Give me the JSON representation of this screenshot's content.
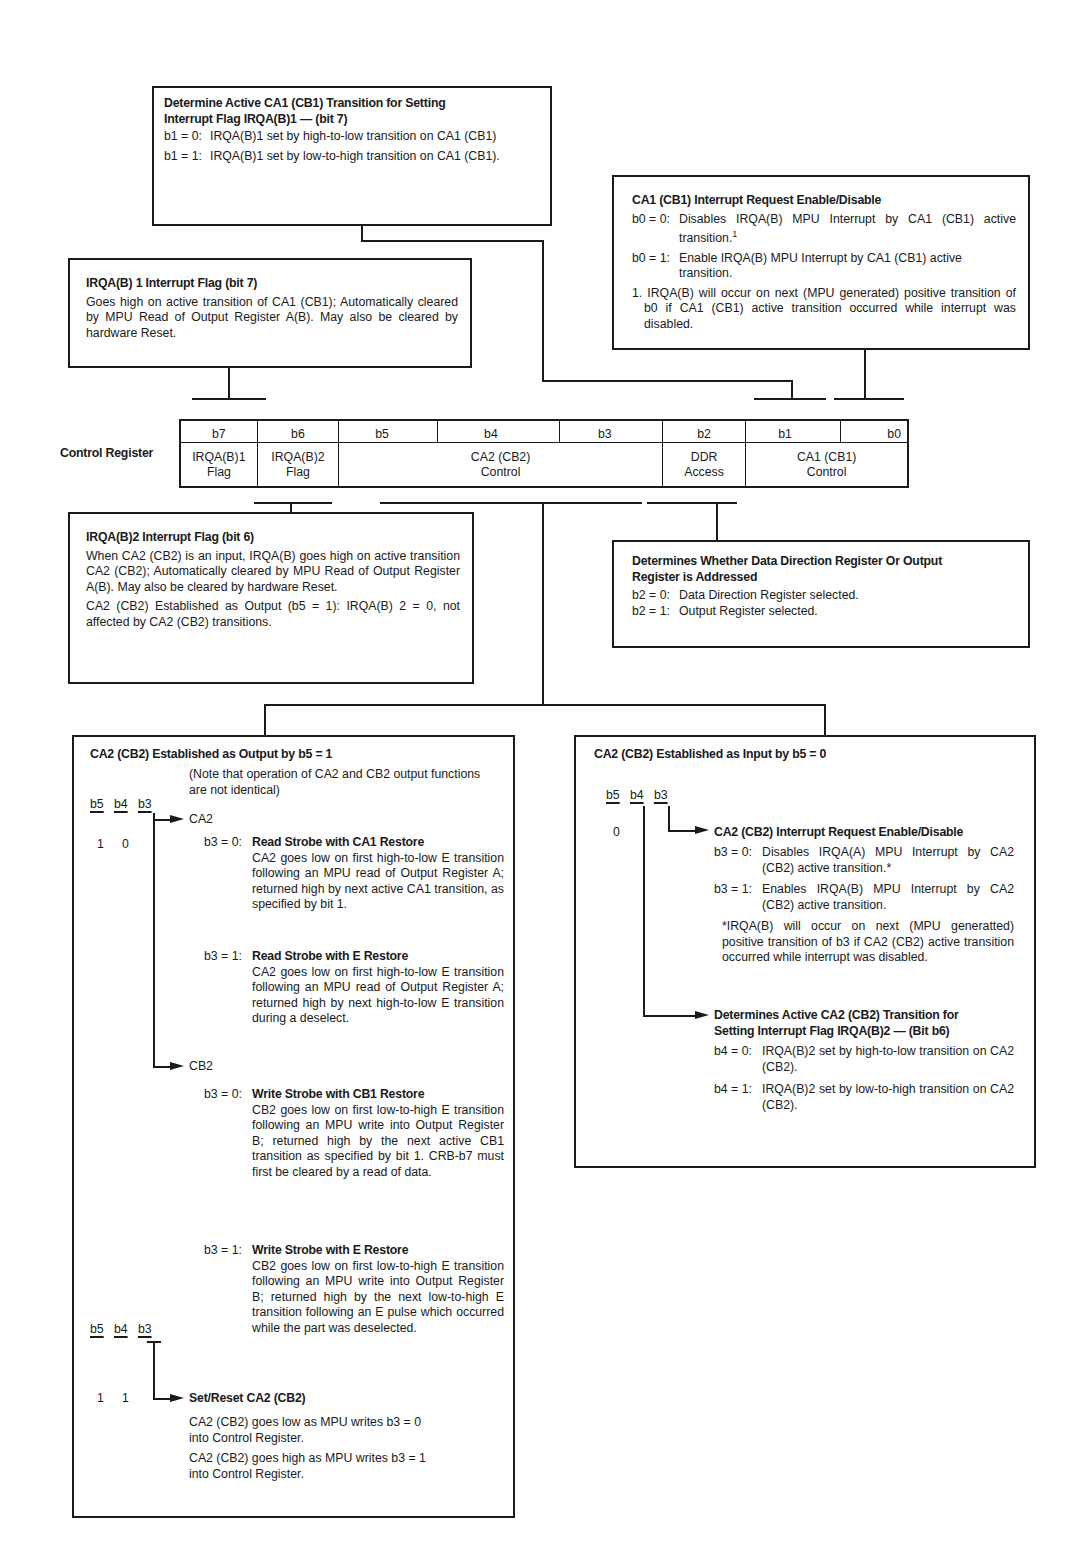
{
  "control_register": {
    "label": "Control Register",
    "bits": [
      "b7",
      "b6",
      "b5",
      "b4",
      "b3",
      "b2",
      "b1",
      "b0"
    ],
    "fields": [
      {
        "line1": "IRQA(B)1",
        "line2": "Flag"
      },
      {
        "line1": "IRQA(B)2",
        "line2": "Flag"
      },
      {
        "line1": "CA2 (CB2)",
        "line2": "Control"
      },
      {
        "line1": "DDR",
        "line2": "Access"
      },
      {
        "line1": "CA1 (CB1)",
        "line2": "Control"
      }
    ]
  },
  "box_ca1_transition": {
    "title_line1": "Determine Active CA1 (CB1) Transition for Setting",
    "title_line2": "Interrupt Flag IRQA(B)1 — (bit 7)",
    "items": [
      {
        "label": "b1 = 0:",
        "text": "IRQA(B)1 set by high-to-low transition on CA1 (CB1)"
      },
      {
        "label": "b1 = 1:",
        "text": "IRQA(B)1 set by low-to-high transition on CA1 (CB1)."
      }
    ]
  },
  "box_ca1_enable": {
    "title": "CA1 (CB1) Interrupt Request Enable/Disable",
    "items": [
      {
        "label": "b0 = 0:",
        "text": "Disables IRQA(B) MPU Interrupt by CA1 (CB1) active transition.",
        "sup": "1"
      },
      {
        "label": "b0 = 1:",
        "text": "Enable IRQA(B) MPU Interrupt by CA1 (CB1) active transition."
      }
    ],
    "footnote": "1. IRQA(B) will occur on next (MPU generated) positive transition of b0 if CA1 (CB1) active transition occurred while interrupt was disabled."
  },
  "box_irq1_flag": {
    "title": "IRQA(B) 1 Interrupt Flag (bit 7)",
    "text": "Goes high on active transition of CA1 (CB1); Automatically cleared by MPU Read of Output Register A(B). May also be cleared by hardware Reset."
  },
  "box_irq2_flag": {
    "title": "IRQA(B)2 Interrupt Flag (bit 6)",
    "text1": "When CA2 (CB2) is an input, IRQA(B) goes high on active transition CA2 (CB2); Automatically cleared by MPU Read of Output Register A(B). May also be cleared by hardware Reset.",
    "text2": "CA2 (CB2) Established as Output (b5 = 1): IRQA(B) 2 = 0, not affected by CA2 (CB2) transitions."
  },
  "box_ddr": {
    "title_line1": "Determines Whether Data Direction Register Or Output",
    "title_line2": "Register is Addressed",
    "items": [
      {
        "label": "b2 = 0:",
        "text": "Data Direction Register selected."
      },
      {
        "label": "b2 = 1:",
        "text": "Output Register selected."
      }
    ]
  },
  "box_output": {
    "title": "CA2 (CB2) Established as Output by b5 = 1",
    "note": "(Note that operation of CA2 and CB2 output functions are not identical)",
    "bit_headers": [
      "b5",
      "b4",
      "b3"
    ],
    "values_1": [
      "1",
      "0"
    ],
    "values_2": [
      "1",
      "1"
    ],
    "ca2_label": "CA2",
    "cb2_label": "CB2",
    "ca2_items": [
      {
        "label": "b3 = 0:",
        "title": "Read Strobe with CA1 Restore",
        "text": "CA2 goes low on first high-to-low E transition following an MPU read of Output Register A; returned high by next active CA1 transition, as specified by bit 1."
      },
      {
        "label": "b3 = 1:",
        "title": "Read Strobe with E Restore",
        "text": "CA2 goes low on first high-to-low E transition following an MPU read of Output Register A; returned high by next high-to-low E transition during a deselect."
      }
    ],
    "cb2_items": [
      {
        "label": "b3 = 0:",
        "title": "Write Strobe with CB1 Restore",
        "text": "CB2 goes low on first low-to-high E transition following an MPU write into Output Register B; returned high by the next active CB1 transition as specified by bit 1. CRB-b7 must first be cleared by a read of data."
      },
      {
        "label": "b3 = 1:",
        "title": "Write Strobe with E Restore",
        "text": "CB2 goes low on first low-to-high E transition following an MPU write into Output Register B; returned high by the next low-to-high E transition following an E pulse which occurred while the part was deselected."
      }
    ],
    "set_reset_title": "Set/Reset CA2 (CB2)",
    "set_reset_text1": "CA2 (CB2) goes low as MPU writes b3 = 0 into Control Register.",
    "set_reset_text2": "CA2 (CB2) goes high as MPU writes b3 = 1 into Control Register."
  },
  "box_input": {
    "title": "CA2 (CB2) Established as Input by b5 = 0",
    "bit_headers": [
      "b5",
      "b4",
      "b3"
    ],
    "value": "0",
    "enable_title": "CA2 (CB2) Interrupt Request Enable/Disable",
    "enable_items": [
      {
        "label": "b3 = 0:",
        "text": "Disables IRQA(A) MPU Interrupt by CA2 (CB2) active transition.*"
      },
      {
        "label": "b3 = 1:",
        "text": "Enables IRQA(B) MPU Interrupt by CA2 (CB2) active transition."
      }
    ],
    "footnote": "*IRQA(B) will occur on next (MPU generatted) positive transition of b3 if CA2 (CB2) active transition occurred while interrupt was disabled.",
    "transition_title_line1": "Determines Active CA2 (CB2) Transition for",
    "transition_title_line2": "Setting Interrupt Flag IRQA(B)2 — (Bit b6)",
    "transition_items": [
      {
        "label": "b4 = 0:",
        "text": "IRQA(B)2 set by high-to-low transition on CA2 (CB2)."
      },
      {
        "label": "b4 = 1:",
        "text": "IRQA(B)2 set by low-to-high transition on CA2 (CB2)."
      }
    ]
  }
}
